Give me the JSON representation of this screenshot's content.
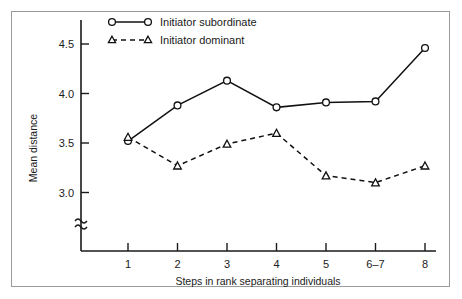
{
  "chart_data": {
    "type": "line",
    "title": "",
    "xlabel": "Steps in rank separating individuals",
    "ylabel": "Mean distance",
    "categories": [
      "1",
      "2",
      "3",
      "4",
      "5",
      "6–7",
      "8"
    ],
    "ytick_labels": [
      "3.0",
      "3.5",
      "4.0",
      "4.5"
    ],
    "ytick_values": [
      3.0,
      3.5,
      4.0,
      4.5
    ],
    "ylim": [
      2.86,
      4.62
    ],
    "axis_break": true,
    "grid": false,
    "legend_position": "top-center",
    "series": [
      {
        "name": "Initiator subordinate",
        "marker": "circle",
        "line_style": "solid",
        "values": [
          3.52,
          3.88,
          4.13,
          3.86,
          3.91,
          3.92,
          4.46
        ]
      },
      {
        "name": "Initiator dominant",
        "marker": "triangle",
        "line_style": "dashed",
        "values": [
          3.56,
          3.27,
          3.49,
          3.6,
          3.17,
          3.1,
          3.27
        ]
      }
    ]
  },
  "axes": {
    "y_label": "Mean distance",
    "x_label": "Steps in rank separating individuals",
    "y_ticks": [
      {
        "label": "4.5"
      },
      {
        "label": "4.0"
      },
      {
        "label": "3.5"
      },
      {
        "label": "3.0"
      }
    ],
    "x_ticks": [
      {
        "label": "1"
      },
      {
        "label": "2"
      },
      {
        "label": "3"
      },
      {
        "label": "4"
      },
      {
        "label": "5"
      },
      {
        "label": "6–7"
      },
      {
        "label": "8"
      }
    ]
  },
  "legend": {
    "entries": [
      {
        "label": "Initiator subordinate",
        "marker": "circle-icon",
        "style": "solid"
      },
      {
        "label": "Initiator dominant",
        "marker": "triangle-icon",
        "style": "dashed"
      }
    ]
  },
  "colors": {
    "ink": "#111111",
    "frame": "#9a9a9a",
    "background": "#ffffff"
  }
}
